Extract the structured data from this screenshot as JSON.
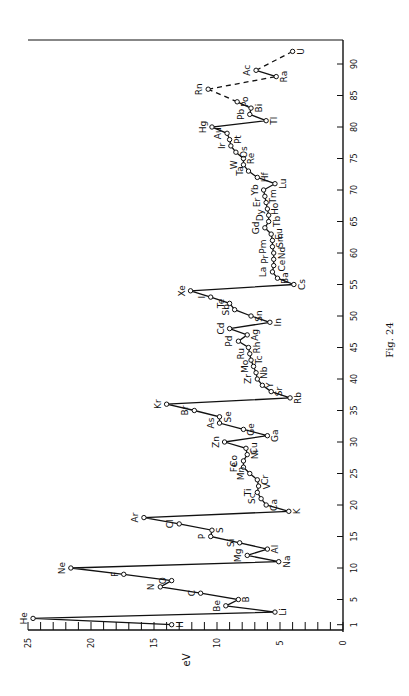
{
  "figure": {
    "caption": "Fig. 24"
  },
  "chart_data": {
    "type": "line",
    "title": "",
    "caption": "Fig. 24",
    "orientation": "rotated 90° counter-clockwise (atomic number axis runs vertically on right, eV axis along bottom)",
    "xlabel": "",
    "ylabel": "eV",
    "xlim": [
      1,
      92
    ],
    "ylim": [
      0,
      25
    ],
    "x_ticks": [
      1,
      5,
      10,
      15,
      20,
      25,
      30,
      35,
      40,
      45,
      50,
      55,
      60,
      65,
      70,
      75,
      80,
      85,
      90
    ],
    "x_tick_labels": [
      "1",
      "5",
      "10",
      "15",
      "20",
      "25",
      "30",
      "35",
      "40",
      "45",
      "50",
      "55",
      "60",
      "65",
      "70",
      "75",
      "80",
      "85",
      "90"
    ],
    "y_ticks": [
      0,
      5,
      10,
      15,
      20,
      25
    ],
    "y_tick_labels": [
      "0",
      "5",
      "10",
      "15",
      "20",
      "25"
    ],
    "grid": false,
    "legend": null,
    "series": [
      {
        "name": "First ionization energy (solid)",
        "style": "solid",
        "points": [
          {
            "Z": 1,
            "symbol": "H",
            "eV": 13.6
          },
          {
            "Z": 2,
            "symbol": "He",
            "eV": 24.6
          },
          {
            "Z": 3,
            "symbol": "Li",
            "eV": 5.4
          },
          {
            "Z": 4,
            "symbol": "Be",
            "eV": 9.3
          },
          {
            "Z": 5,
            "symbol": "B",
            "eV": 8.3
          },
          {
            "Z": 6,
            "symbol": "C",
            "eV": 11.3
          },
          {
            "Z": 7,
            "symbol": "N",
            "eV": 14.5
          },
          {
            "Z": 8,
            "symbol": "O",
            "eV": 13.6
          },
          {
            "Z": 9,
            "symbol": "F",
            "eV": 17.4
          },
          {
            "Z": 10,
            "symbol": "Ne",
            "eV": 21.6
          },
          {
            "Z": 11,
            "symbol": "Na",
            "eV": 5.1
          },
          {
            "Z": 12,
            "symbol": "Mg",
            "eV": 7.6
          },
          {
            "Z": 13,
            "symbol": "Al",
            "eV": 6.0
          },
          {
            "Z": 14,
            "symbol": "Si",
            "eV": 8.2
          },
          {
            "Z": 15,
            "symbol": "P",
            "eV": 10.5
          },
          {
            "Z": 16,
            "symbol": "S",
            "eV": 10.4
          },
          {
            "Z": 17,
            "symbol": "Cl",
            "eV": 13.0
          },
          {
            "Z": 18,
            "symbol": "Ar",
            "eV": 15.8
          },
          {
            "Z": 19,
            "symbol": "K",
            "eV": 4.3
          },
          {
            "Z": 20,
            "symbol": "Ca",
            "eV": 6.1
          },
          {
            "Z": 21,
            "symbol": "Sc",
            "eV": 6.5
          },
          {
            "Z": 22,
            "symbol": "Ti",
            "eV": 6.8
          },
          {
            "Z": 23,
            "symbol": "V",
            "eV": 6.7
          },
          {
            "Z": 24,
            "symbol": "Cr",
            "eV": 6.8
          },
          {
            "Z": 25,
            "symbol": "Mn",
            "eV": 7.4
          },
          {
            "Z": 26,
            "symbol": "Fe",
            "eV": 7.9
          },
          {
            "Z": 27,
            "symbol": "Co",
            "eV": 7.9
          },
          {
            "Z": 28,
            "symbol": "Ni",
            "eV": 7.6
          },
          {
            "Z": 29,
            "symbol": "Cu",
            "eV": 7.7
          },
          {
            "Z": 30,
            "symbol": "Zn",
            "eV": 9.4
          },
          {
            "Z": 31,
            "symbol": "Ga",
            "eV": 6.0
          },
          {
            "Z": 32,
            "symbol": "Ge",
            "eV": 7.9
          },
          {
            "Z": 33,
            "symbol": "As",
            "eV": 9.8
          },
          {
            "Z": 34,
            "symbol": "Se",
            "eV": 9.8
          },
          {
            "Z": 35,
            "symbol": "Br",
            "eV": 11.8
          },
          {
            "Z": 36,
            "symbol": "Kr",
            "eV": 14.0
          },
          {
            "Z": 37,
            "symbol": "Rb",
            "eV": 4.2
          },
          {
            "Z": 38,
            "symbol": "Sr",
            "eV": 5.7
          },
          {
            "Z": 39,
            "symbol": "Y",
            "eV": 6.4
          },
          {
            "Z": 40,
            "symbol": "Zr",
            "eV": 6.8
          },
          {
            "Z": 41,
            "symbol": "Nb",
            "eV": 6.9
          },
          {
            "Z": 42,
            "symbol": "Mo",
            "eV": 7.1
          },
          {
            "Z": 43,
            "symbol": "Tc",
            "eV": 7.3
          },
          {
            "Z": 44,
            "symbol": "Ru",
            "eV": 7.4
          },
          {
            "Z": 45,
            "symbol": "Rh",
            "eV": 7.5
          },
          {
            "Z": 46,
            "symbol": "Pd",
            "eV": 8.3
          },
          {
            "Z": 47,
            "symbol": "Ag",
            "eV": 7.6
          },
          {
            "Z": 48,
            "symbol": "Cd",
            "eV": 9.0
          },
          {
            "Z": 49,
            "symbol": "In",
            "eV": 5.8
          },
          {
            "Z": 50,
            "symbol": "Sn",
            "eV": 7.3
          },
          {
            "Z": 51,
            "symbol": "Sb",
            "eV": 8.6
          },
          {
            "Z": 52,
            "symbol": "Te",
            "eV": 9.0
          },
          {
            "Z": 53,
            "symbol": "I",
            "eV": 10.5
          },
          {
            "Z": 54,
            "symbol": "Xe",
            "eV": 12.1
          },
          {
            "Z": 55,
            "symbol": "Cs",
            "eV": 3.9
          },
          {
            "Z": 56,
            "symbol": "Ba",
            "eV": 5.2
          },
          {
            "Z": 57,
            "symbol": "La",
            "eV": 5.6
          },
          {
            "Z": 58,
            "symbol": "Ce",
            "eV": 5.5
          },
          {
            "Z": 59,
            "symbol": "Pr",
            "eV": 5.5
          },
          {
            "Z": 60,
            "symbol": "Nd",
            "eV": 5.5
          },
          {
            "Z": 61,
            "symbol": "Pm",
            "eV": 5.6
          },
          {
            "Z": 62,
            "symbol": "Sm",
            "eV": 5.6
          },
          {
            "Z": 63,
            "symbol": "Eu",
            "eV": 5.7
          },
          {
            "Z": 64,
            "symbol": "Gd",
            "eV": 6.2
          },
          {
            "Z": 65,
            "symbol": "Tb",
            "eV": 5.9
          },
          {
            "Z": 66,
            "symbol": "Dy",
            "eV": 5.9
          },
          {
            "Z": 67,
            "symbol": "Ho",
            "eV": 6.0
          },
          {
            "Z": 68,
            "symbol": "Er",
            "eV": 6.1
          },
          {
            "Z": 69,
            "symbol": "Tm",
            "eV": 6.2
          },
          {
            "Z": 70,
            "symbol": "Yb",
            "eV": 6.3
          },
          {
            "Z": 71,
            "symbol": "Lu",
            "eV": 5.4
          },
          {
            "Z": 72,
            "symbol": "Hf",
            "eV": 6.8
          },
          {
            "Z": 73,
            "symbol": "Ta",
            "eV": 7.5
          },
          {
            "Z": 74,
            "symbol": "W",
            "eV": 7.9
          },
          {
            "Z": 75,
            "symbol": "Re",
            "eV": 7.9
          },
          {
            "Z": 76,
            "symbol": "Os",
            "eV": 8.5
          },
          {
            "Z": 77,
            "symbol": "Ir",
            "eV": 8.9
          },
          {
            "Z": 78,
            "symbol": "Pt",
            "eV": 9.0
          },
          {
            "Z": 79,
            "symbol": "Au",
            "eV": 9.2
          },
          {
            "Z": 80,
            "symbol": "Hg",
            "eV": 10.4
          },
          {
            "Z": 81,
            "symbol": "Tl",
            "eV": 6.1
          },
          {
            "Z": 82,
            "symbol": "Pb",
            "eV": 7.4
          },
          {
            "Z": 83,
            "symbol": "Bi",
            "eV": 7.3
          },
          {
            "Z": 84,
            "symbol": "Po",
            "eV": 8.4
          }
        ]
      },
      {
        "name": "Estimated (dashed)",
        "style": "dashed",
        "points": [
          {
            "Z": 84,
            "symbol": "Po",
            "eV": 8.4
          },
          {
            "Z": 86,
            "symbol": "Rn",
            "eV": 10.7
          },
          {
            "Z": 88,
            "symbol": "Ra",
            "eV": 5.3
          },
          {
            "Z": 89,
            "symbol": "Ac",
            "eV": 6.9
          },
          {
            "Z": 92,
            "symbol": "U",
            "eV": 4.0
          }
        ],
        "note": "Ra–Ac segment drawn solid"
      }
    ]
  }
}
